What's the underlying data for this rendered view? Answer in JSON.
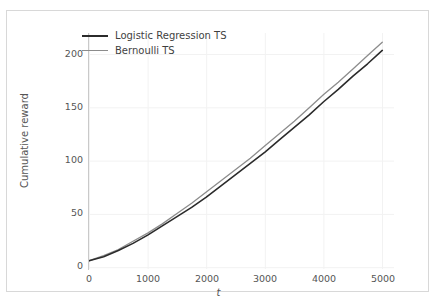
{
  "chart_data": {
    "type": "line",
    "title": "",
    "xlabel": "t",
    "ylabel": "Cumulative reward",
    "xlim": [
      0,
      5200
    ],
    "ylim": [
      -8,
      222
    ],
    "grid": true,
    "legend_position": "upper left",
    "xticks": [
      "0",
      "1000",
      "2000",
      "3000",
      "4000",
      "5000"
    ],
    "xtick_values": [
      0,
      1000,
      2000,
      3000,
      4000,
      5000
    ],
    "yticks": [
      "0",
      "50",
      "100",
      "150",
      "200"
    ],
    "ytick_values": [
      0,
      50,
      100,
      150,
      200
    ],
    "x": [
      0,
      250,
      500,
      750,
      1000,
      1250,
      1500,
      1750,
      2000,
      2250,
      2500,
      2750,
      3000,
      3250,
      3500,
      3750,
      4000,
      4250,
      4500,
      4750,
      5000
    ],
    "series": [
      {
        "name": "Logistic Regression TS",
        "color": "#2b2b2b",
        "linewidth": 1.6,
        "values": [
          0,
          4,
          10,
          17,
          25,
          34,
          43,
          52,
          62,
          73,
          84,
          95,
          106,
          118,
          130,
          142,
          155,
          167,
          180,
          192,
          205
        ]
      },
      {
        "name": "Bernoulli TS",
        "color": "#8c8c8c",
        "linewidth": 1.3,
        "values": [
          0,
          5,
          11,
          19,
          27,
          36,
          46,
          56,
          67,
          78,
          89,
          100,
          112,
          124,
          136,
          149,
          162,
          174,
          187,
          200,
          213
        ]
      }
    ]
  },
  "legend": {
    "items": [
      {
        "label": "Logistic Regression TS"
      },
      {
        "label": "Bernoulli TS"
      }
    ]
  },
  "axes": {
    "xlabel": "t",
    "ylabel": "Cumulative reward",
    "xticks": [
      "0",
      "1000",
      "2000",
      "3000",
      "4000",
      "5000"
    ],
    "yticks": [
      "200",
      "150",
      "100",
      "50",
      "0"
    ]
  },
  "colors": {
    "series_1": "#2b2b2b",
    "series_2": "#8c8c8c",
    "grid": "#f2f2f2",
    "text": "#555555",
    "figure_border": "#d8d8d8",
    "background": "#ffffff"
  }
}
